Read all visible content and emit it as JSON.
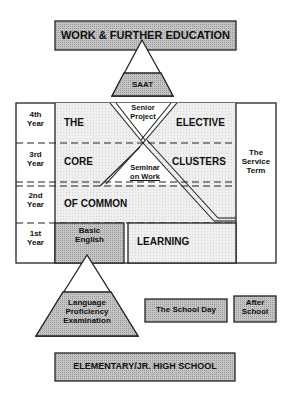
{
  "diagram": {
    "top_box": {
      "label": "WORK & FURTHER EDUCATION"
    },
    "saat": {
      "label": "SAAT"
    },
    "years": [
      {
        "label": "4th\nYear",
        "line1": "4th",
        "line2": "Year"
      },
      {
        "label": "3rd\nYear",
        "line1": "3rd",
        "line2": "Year"
      },
      {
        "label": "2nd\nYear",
        "line1": "2nd",
        "line2": "Year"
      },
      {
        "label": "1st\nYear",
        "line1": "1st",
        "line2": "Year"
      }
    ],
    "core_text": {
      "the": "THE",
      "core": "CORE",
      "of_common": "OF COMMON",
      "learning": "LEARNING"
    },
    "elective_text": {
      "elective": "ELECTIVE",
      "clusters": "CLUSTERS"
    },
    "senior_project": {
      "line1": "Senior",
      "line2": "Project"
    },
    "seminar_on_work": {
      "line1": "Seminar",
      "line2": "on Work"
    },
    "service_term": {
      "line1": "The",
      "line2": "Service",
      "line3": "Term"
    },
    "basic_english": {
      "line1": "Basic",
      "line2": "English"
    },
    "language_exam": {
      "line1": "Language",
      "line2": "Proficiency",
      "line3": "Examination"
    },
    "legend": {
      "school_day": "The School Day",
      "after_school_line1": "After",
      "after_school_line2": "School"
    },
    "bottom_box": {
      "label": "ELEMENTARY/JR. HIGH SCHOOL"
    },
    "colors": {
      "shaded_fill": "#c4c4c4",
      "light_fill": "#ececec",
      "stroke": "#222222",
      "background": "#ffffff"
    }
  }
}
